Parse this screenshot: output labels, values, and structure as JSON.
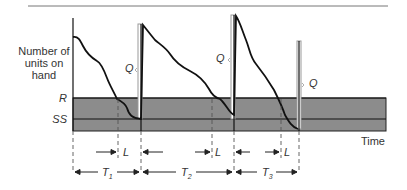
{
  "diagram": {
    "y_axis_label": [
      "Number of",
      "units on",
      "hand"
    ],
    "x_axis_label": "Time",
    "levels": {
      "reorder_point": "R",
      "safety_stock": "SS"
    },
    "order_quantity_label": "Q",
    "lead_time_label": "L",
    "cycle_labels": [
      {
        "base": "T",
        "sub": "1"
      },
      {
        "base": "T",
        "sub": "2"
      },
      {
        "base": "T",
        "sub": "3"
      }
    ],
    "colors": {
      "band": "#8c8c8c",
      "line": "#111111",
      "order_bar": "#9a9a9a",
      "text": "#333333"
    }
  }
}
